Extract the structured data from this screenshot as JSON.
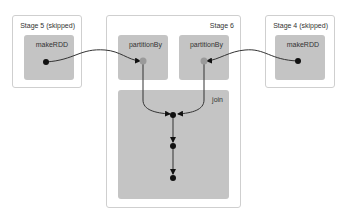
{
  "diagram": {
    "stages": [
      {
        "label": "Stage 5 (skipped)",
        "rdds": [
          {
            "label": "makeRDD"
          }
        ]
      },
      {
        "label": "Stage 6",
        "rdds": [
          {
            "label": "partitionBy"
          },
          {
            "label": "partitionBy"
          },
          {
            "label": "join"
          }
        ]
      },
      {
        "label": "Stage 4 (skipped)",
        "rdds": [
          {
            "label": "makeRDD"
          }
        ]
      }
    ],
    "edges": [
      {
        "from": "Stage 5 makeRDD",
        "to": "Stage 6 partitionBy (left)"
      },
      {
        "from": "Stage 4 makeRDD",
        "to": "Stage 6 partitionBy (right)"
      },
      {
        "from": "partitionBy (left)",
        "to": "join"
      },
      {
        "from": "partitionBy (right)",
        "to": "join"
      }
    ],
    "colors": {
      "stage_border": "#cfcfcf",
      "rdd_fill": "#c4c4c4",
      "edge": "#333333",
      "node": "#111111",
      "cached_node": "#9a9a9a"
    }
  }
}
